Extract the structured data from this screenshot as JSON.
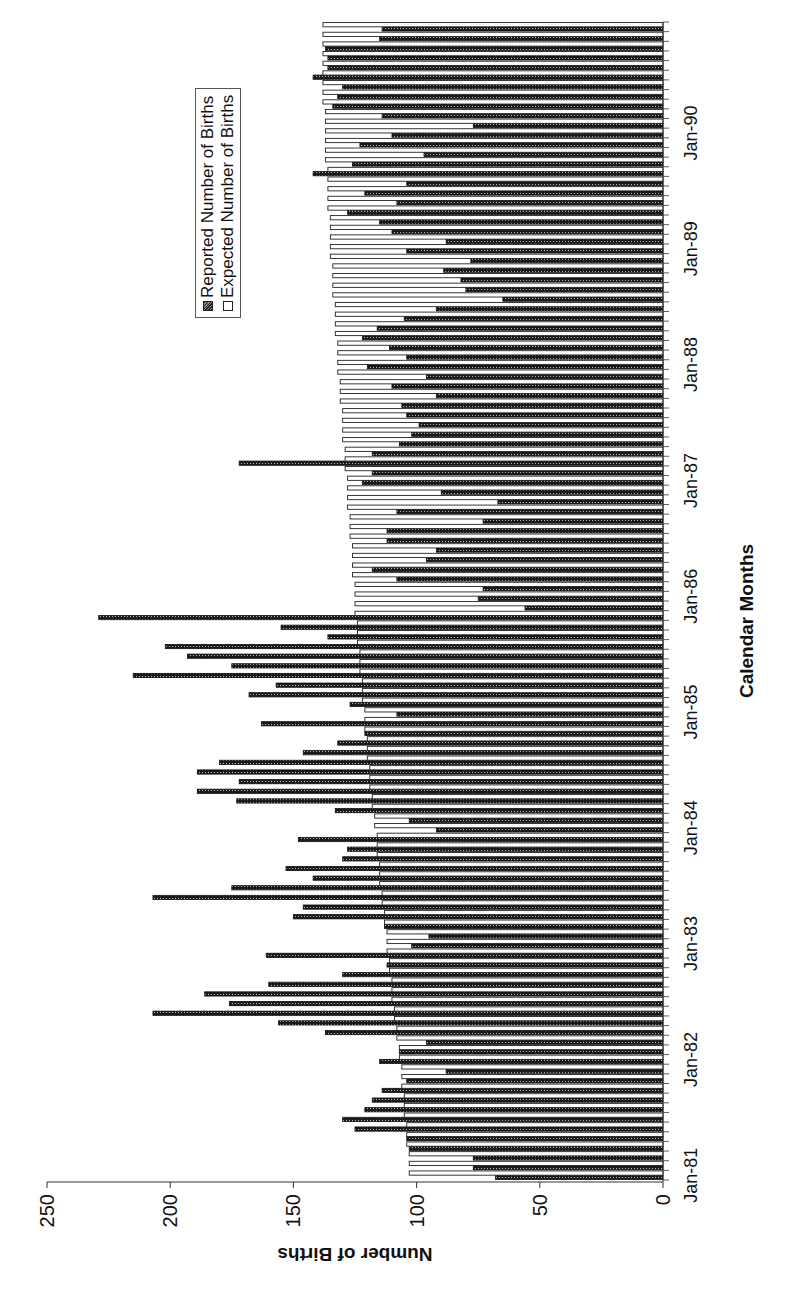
{
  "chart_data": {
    "type": "bar",
    "orientation": "rotated -90deg (bars extend leftward; category axis on right, Jan-81 at bottom)",
    "title": "",
    "xlabel": "Calendar Months",
    "ylabel": "Number of Births",
    "ylim": [
      0,
      250
    ],
    "yticks": [
      0,
      50,
      100,
      150,
      200,
      250
    ],
    "xtick_labels": [
      "Jan-81",
      "Jan-82",
      "Jan-83",
      "Jan-84",
      "Jan-85",
      "Jan-86",
      "Jan-87",
      "Jan-88",
      "Jan-89",
      "Jan-90"
    ],
    "legend": [
      "Reported Number of Births",
      "Expected Number of Births"
    ],
    "legend_position": "upper inside plot",
    "grid": false,
    "start_month": "Jan-81",
    "n_months": 120,
    "series": [
      {
        "name": "Reported Number of Births",
        "values": [
          68,
          77,
          77,
          103,
          104,
          125,
          130,
          121,
          118,
          114,
          104,
          88,
          115,
          107,
          96,
          137,
          156,
          207,
          176,
          186,
          160,
          130,
          112,
          161,
          102,
          95,
          113,
          150,
          146,
          207,
          175,
          142,
          153,
          130,
          128,
          148,
          92,
          103,
          133,
          173,
          189,
          172,
          189,
          180,
          146,
          132,
          121,
          163,
          108,
          127,
          168,
          157,
          215,
          175,
          193,
          202,
          136,
          155,
          229,
          56,
          75,
          73,
          108,
          118,
          96,
          92,
          112,
          112,
          73,
          108,
          67,
          90,
          122,
          118,
          172,
          118,
          107,
          102,
          99,
          104,
          106,
          92,
          110,
          96,
          120,
          104,
          111,
          122,
          116,
          105,
          92,
          65,
          80,
          82,
          89,
          78,
          104,
          88,
          110,
          115,
          128,
          108,
          121,
          104,
          142,
          126,
          97,
          123,
          110,
          77,
          114,
          134,
          132,
          130,
          142,
          136,
          136,
          137,
          115,
          114
        ]
      },
      {
        "name": "Expected Number of Births",
        "values": [
          103,
          103,
          103,
          104,
          104,
          104,
          105,
          105,
          105,
          106,
          106,
          106,
          107,
          107,
          108,
          108,
          109,
          109,
          110,
          110,
          110,
          111,
          111,
          112,
          112,
          112,
          113,
          113,
          114,
          114,
          115,
          115,
          115,
          116,
          116,
          116,
          117,
          117,
          118,
          118,
          119,
          119,
          119,
          120,
          120,
          120,
          121,
          121,
          121,
          122,
          122,
          122,
          123,
          123,
          123,
          124,
          124,
          124,
          125,
          125,
          125,
          125,
          126,
          126,
          126,
          126,
          127,
          127,
          127,
          128,
          128,
          128,
          128,
          129,
          129,
          129,
          130,
          130,
          130,
          130,
          131,
          131,
          131,
          132,
          132,
          132,
          132,
          133,
          133,
          133,
          133,
          134,
          134,
          134,
          134,
          135,
          135,
          135,
          135,
          135,
          136,
          136,
          136,
          136,
          136,
          137,
          137,
          137,
          137,
          137,
          137,
          138,
          138,
          138,
          138,
          138,
          138,
          138,
          138,
          138
        ]
      }
    ]
  },
  "axes": {
    "y_title": "Number of Births",
    "x_title": "Calendar Months"
  },
  "legend": {
    "reported": "Reported Number of Births",
    "expected": "Expected Number of Births"
  }
}
